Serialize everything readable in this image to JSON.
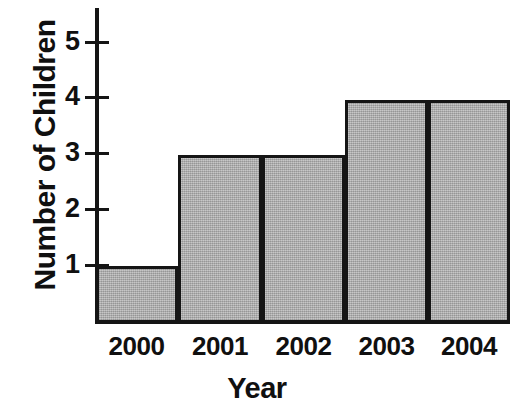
{
  "chart_data": {
    "type": "bar",
    "title": "",
    "xlabel": "Year",
    "ylabel": "Number of Children",
    "categories": [
      "2000",
      "2001",
      "2002",
      "2003",
      "2004"
    ],
    "values": [
      1,
      3,
      3,
      4,
      4
    ],
    "ylim": [
      0,
      5.6
    ],
    "yticks": [
      1,
      2,
      3,
      4,
      5
    ],
    "ytick_labels": [
      "1",
      "2",
      "3",
      "4",
      "5"
    ],
    "grid": false,
    "legend": null,
    "bar_fill_color": "#b2b2b2",
    "bar_border_color": "#151515",
    "axis_color": "#151515",
    "background_color": "#ffffff"
  },
  "axes": {
    "y_title": "Number of Children",
    "x_title": "Year"
  },
  "ytick_labels": {
    "t1": "1",
    "t2": "2",
    "t3": "3",
    "t4": "4",
    "t5": "5"
  },
  "xtick_labels": {
    "c0": "2000",
    "c1": "2001",
    "c2": "2002",
    "c3": "2003",
    "c4": "2004"
  }
}
